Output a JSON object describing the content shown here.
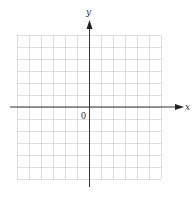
{
  "diagram": {
    "type": "coordinate-plane",
    "x_axis_label": "x",
    "y_axis_label": "y",
    "origin_label": "0",
    "grid": {
      "columns": 12,
      "rows": 12,
      "cell_size_px": 12,
      "line_style": "dotted",
      "line_color": "#bdbdbd"
    },
    "axis_color": "#333333"
  }
}
